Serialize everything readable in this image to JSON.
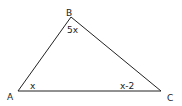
{
  "diagram": {
    "type": "triangle",
    "vertices": [
      {
        "id": "A",
        "label": "A",
        "angle_label": "x",
        "x": 18,
        "y": 91
      },
      {
        "id": "B",
        "label": "B",
        "angle_label": "5x",
        "x": 71,
        "y": 17
      },
      {
        "id": "C",
        "label": "C",
        "angle_label": "x-2",
        "x": 161,
        "y": 91
      }
    ],
    "edges": [
      {
        "from": "A",
        "to": "B"
      },
      {
        "from": "B",
        "to": "C"
      },
      {
        "from": "C",
        "to": "A"
      }
    ],
    "colors": {
      "stroke": "#222222",
      "text": "#222222",
      "background": "#ffffff"
    }
  }
}
